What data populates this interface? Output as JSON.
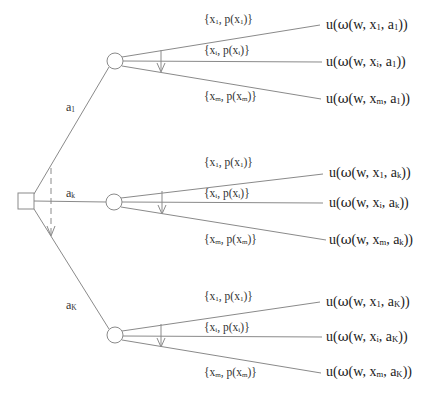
{
  "diagram": {
    "type": "decision-tree",
    "decision_node": {
      "shape": "square"
    },
    "actions": [
      {
        "label": "a",
        "sub": "1"
      },
      {
        "label": "a",
        "sub": "k"
      },
      {
        "label": "a",
        "sub": "K"
      }
    ],
    "branches": [
      {
        "action_sub": "1",
        "outcomes": [
          {
            "x_sub": "1",
            "p_sub": "1"
          },
          {
            "x_sub": "i",
            "p_sub": "i"
          },
          {
            "x_sub": "m",
            "p_sub": "m"
          }
        ]
      },
      {
        "action_sub": "k",
        "outcomes": [
          {
            "x_sub": "1",
            "p_sub": "1"
          },
          {
            "x_sub": "i",
            "p_sub": "i"
          },
          {
            "x_sub": "m",
            "p_sub": "m"
          }
        ]
      },
      {
        "action_sub": "K",
        "outcomes": [
          {
            "x_sub": "1",
            "p_sub": "1"
          },
          {
            "x_sub": "i",
            "p_sub": "i"
          },
          {
            "x_sub": "m",
            "p_sub": "m"
          }
        ]
      }
    ],
    "text": {
      "open_brace": "{x",
      "comma_p": ", p(x",
      "close_outcome": ")}",
      "u_prefix": "u(",
      "omega": "ω",
      "w_part": "(w, x",
      "comma_a": ", a",
      "close_utility": "))",
      "action_letter": "a"
    },
    "colors": {
      "line": "#8a8a8a",
      "text": "#222222",
      "background": "#ffffff"
    }
  }
}
